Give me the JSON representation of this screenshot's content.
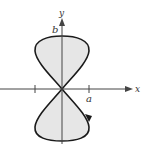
{
  "figure": {
    "type": "parametric-curve",
    "axes": {
      "x_label": "x",
      "y_label": "y"
    },
    "annotations": {
      "x_intercept_label": "a",
      "y_intercept_label": "b"
    },
    "colors": {
      "curve": "#1a1a1a",
      "fill": "#e6e6e6",
      "axis": "#444444"
    }
  }
}
